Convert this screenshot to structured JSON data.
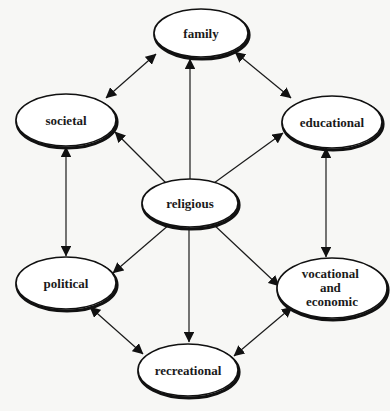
{
  "diagram": {
    "title": "",
    "center_node": "religious",
    "nodes": [
      {
        "id": "family",
        "label": "family",
        "cx": 201,
        "cy": 33,
        "rx": 47,
        "ry": 24
      },
      {
        "id": "societal",
        "label": "societal",
        "cx": 66,
        "cy": 120,
        "rx": 50,
        "ry": 26
      },
      {
        "id": "educational",
        "label": "educational",
        "cx": 332,
        "cy": 122,
        "rx": 50,
        "ry": 26
      },
      {
        "id": "religious",
        "label": "religious",
        "cx": 190,
        "cy": 203,
        "rx": 48,
        "ry": 24
      },
      {
        "id": "political",
        "label": "political",
        "cx": 66,
        "cy": 283,
        "rx": 50,
        "ry": 26
      },
      {
        "id": "vocational",
        "label_lines": [
          "vocational",
          "and",
          "economic"
        ],
        "cx": 332,
        "cy": 288,
        "rx": 55,
        "ry": 30
      },
      {
        "id": "recreational",
        "label": "recreational",
        "cx": 188,
        "cy": 370,
        "rx": 50,
        "ry": 26
      }
    ],
    "edges": [
      {
        "from": "religious",
        "to": "family",
        "direction": "forward"
      },
      {
        "from": "religious",
        "to": "societal",
        "direction": "forward"
      },
      {
        "from": "religious",
        "to": "educational",
        "direction": "forward"
      },
      {
        "from": "religious",
        "to": "political",
        "direction": "forward"
      },
      {
        "from": "religious",
        "to": "vocational",
        "direction": "forward"
      },
      {
        "from": "religious",
        "to": "recreational",
        "direction": "forward"
      },
      {
        "from": "family",
        "to": "societal",
        "direction": "both"
      },
      {
        "from": "family",
        "to": "educational",
        "direction": "both"
      },
      {
        "from": "societal",
        "to": "political",
        "direction": "both"
      },
      {
        "from": "educational",
        "to": "vocational",
        "direction": "both"
      },
      {
        "from": "political",
        "to": "recreational",
        "direction": "both"
      },
      {
        "from": "vocational",
        "to": "recreational",
        "direction": "both"
      }
    ]
  }
}
